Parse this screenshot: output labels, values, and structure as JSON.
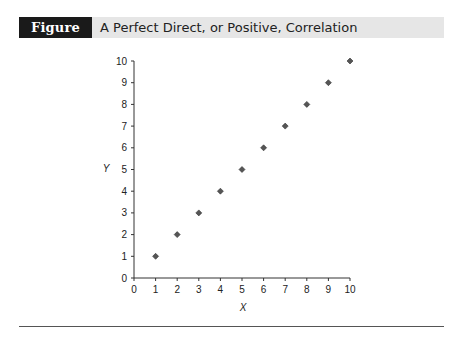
{
  "figure": {
    "label": "Figure 5.2",
    "title": "A Perfect Direct, or Positive, Correlation"
  },
  "colors": {
    "title_bar_bg": "#e6e6e6",
    "label_bg": "#1a1a1a",
    "marker": "#555555",
    "axis": "#333333"
  },
  "chart_data": {
    "type": "scatter",
    "title": "A Perfect Direct, or Positive, Correlation",
    "xlabel": "X",
    "ylabel": "Y",
    "xlim": [
      0,
      10
    ],
    "ylim": [
      0,
      10
    ],
    "x_ticks": [
      0,
      1,
      2,
      3,
      4,
      5,
      6,
      7,
      8,
      9,
      10
    ],
    "y_ticks": [
      0,
      1,
      2,
      3,
      4,
      5,
      6,
      7,
      8,
      9,
      10
    ],
    "grid": false,
    "legend": null,
    "marker": "diamond",
    "series": [
      {
        "name": "Data",
        "x": [
          1,
          2,
          3,
          4,
          5,
          6,
          7,
          8,
          9,
          10
        ],
        "y": [
          1,
          2,
          3,
          4,
          5,
          6,
          7,
          8,
          9,
          10
        ]
      }
    ]
  }
}
